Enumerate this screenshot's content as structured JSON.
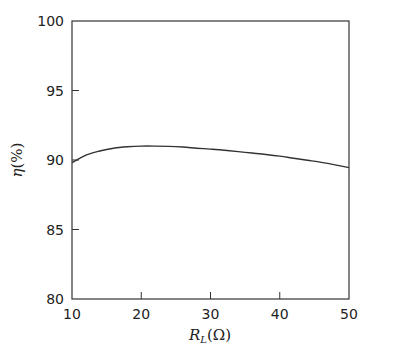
{
  "chart_data": {
    "type": "line",
    "title": "",
    "xlabel": "R_L(Ω)",
    "xlabel_main": "R",
    "xlabel_sub": "L",
    "xlabel_unit": "(Ω)",
    "ylabel": "η(%)",
    "ylabel_main": "η",
    "ylabel_unit": "(%)",
    "xlim": [
      10,
      50
    ],
    "ylim": [
      80,
      100
    ],
    "xticks": [
      10,
      20,
      30,
      40,
      50
    ],
    "yticks": [
      80,
      85,
      90,
      95,
      100
    ],
    "grid": false,
    "legend": null,
    "series": [
      {
        "name": "efficiency",
        "x": [
          10,
          12,
          14,
          16,
          18,
          20,
          22,
          24,
          26,
          28,
          30,
          32,
          34,
          36,
          38,
          40,
          42,
          44,
          46,
          48,
          50
        ],
        "values": [
          89.8,
          90.35,
          90.65,
          90.85,
          90.95,
          91.0,
          91.0,
          90.98,
          90.93,
          90.85,
          90.78,
          90.7,
          90.6,
          90.5,
          90.4,
          90.28,
          90.13,
          89.98,
          89.83,
          89.65,
          89.45
        ]
      }
    ]
  }
}
